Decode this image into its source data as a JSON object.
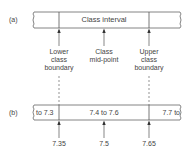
{
  "diagram": {
    "part_a": {
      "label": "(a)",
      "bar_text": "Class interval",
      "annotations": [
        {
          "line1": "Lower",
          "line2": "class",
          "line3": "boundary"
        },
        {
          "line1": "Class",
          "line2": "mid-point",
          "line3": ""
        },
        {
          "line1": "Upper",
          "line2": "class",
          "line3": "boundary"
        }
      ]
    },
    "part_b": {
      "label": "(b)",
      "segments": [
        "to 7.3",
        "7.4 to 7.6",
        "7.7 to"
      ],
      "values": [
        "7.35",
        "7.5",
        "7.65"
      ]
    },
    "colors": {
      "line": "#555555",
      "text": "#444444"
    }
  }
}
